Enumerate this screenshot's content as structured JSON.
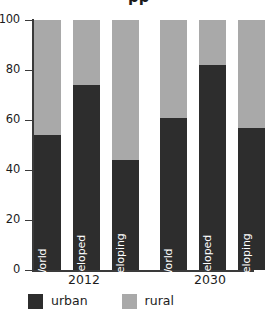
{
  "chart_data": {
    "type": "bar",
    "subtype": "stacked-100-percent",
    "title": "",
    "title_cropped_fragment": "pp",
    "xlabel": "",
    "ylabel": "",
    "ylim": [
      0,
      100
    ],
    "yticks": [
      0,
      20,
      40,
      60,
      80,
      100
    ],
    "ytick_labels": [
      "0",
      "20",
      "40",
      "60",
      "80",
      "100"
    ],
    "grid": false,
    "legend_position": "bottom-left",
    "categories": [
      "World",
      "Developed",
      "Developing",
      "World",
      "Developed",
      "Developing"
    ],
    "groups": [
      {
        "label": "2012",
        "categories": [
          "World",
          "Developed",
          "Developing"
        ]
      },
      {
        "label": "2030",
        "categories": [
          "World",
          "Developed",
          "Developing"
        ]
      }
    ],
    "series": [
      {
        "name": "urban",
        "color": "#2d2d2d",
        "values": [
          54,
          74,
          44,
          61,
          82,
          57
        ]
      },
      {
        "name": "rural",
        "color": "#a9a9a9",
        "values": [
          46,
          26,
          56,
          39,
          18,
          43
        ]
      }
    ],
    "bars": [
      {
        "group": "2012",
        "category": "World",
        "urban": 54,
        "rural": 46
      },
      {
        "group": "2012",
        "category": "Developed",
        "urban": 74,
        "rural": 26
      },
      {
        "group": "2012",
        "category": "Developing",
        "urban": 44,
        "rural": 56
      },
      {
        "group": "2030",
        "category": "World",
        "urban": 61,
        "rural": 39
      },
      {
        "group": "2030",
        "category": "Developed",
        "urban": 82,
        "rural": 18
      },
      {
        "group": "2030",
        "category": "Developing",
        "urban": 57,
        "rural": 43
      }
    ]
  },
  "legend": {
    "items": [
      {
        "label": "urban",
        "color": "#2d2d2d"
      },
      {
        "label": "rural",
        "color": "#a9a9a9"
      }
    ]
  },
  "colors": {
    "urban": "#2d2d2d",
    "rural": "#a9a9a9",
    "axis": "#3a3a3a",
    "text": "#1c1c1c",
    "bar_label_text": "#ffffff",
    "background": "#ffffff"
  }
}
